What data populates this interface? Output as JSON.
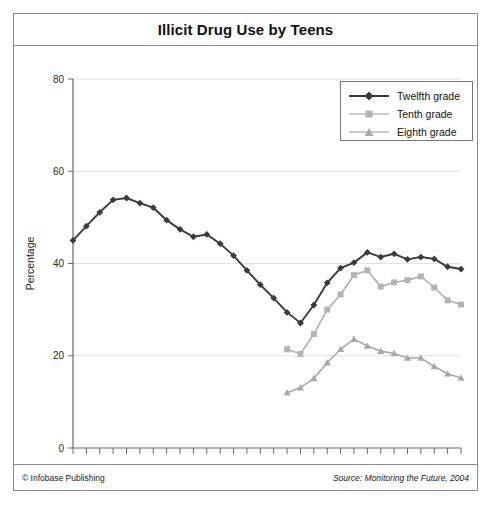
{
  "chart_data": {
    "type": "line",
    "title": "Illicit Drug Use by Teens",
    "xlabel": "Year",
    "ylabel": "Percentage",
    "ylim": [
      0,
      80
    ],
    "yticks": [
      0,
      20,
      40,
      60,
      80
    ],
    "ytick_labels": [
      "0",
      "20",
      "40",
      "60",
      "80"
    ],
    "xlim": [
      1975,
      2004
    ],
    "xtick_labels": [
      "'76",
      "'78",
      "'80",
      "'82",
      "'84",
      "'86",
      "'88",
      "'90",
      "'92",
      "'94",
      "'96",
      "'98",
      "'00",
      "'02",
      "'04"
    ],
    "xtick_years": [
      1976,
      1978,
      1980,
      1982,
      1984,
      1986,
      1988,
      1990,
      1992,
      1994,
      1996,
      1998,
      2000,
      2002,
      2004
    ],
    "minor_tick_years": [
      1975,
      1977,
      1979,
      1981,
      1983,
      1985,
      1987,
      1989,
      1991,
      1993,
      1995,
      1997,
      1999,
      2001,
      2003
    ],
    "grid": "horizontal",
    "legend_position": "top-right",
    "series": [
      {
        "name": "Twelfth grade",
        "marker": "diamond",
        "color": "#3b3b3b",
        "x": [
          1975,
          1976,
          1977,
          1978,
          1979,
          1980,
          1981,
          1982,
          1983,
          1984,
          1985,
          1986,
          1987,
          1988,
          1989,
          1990,
          1991,
          1992,
          1993,
          1994,
          1995,
          1996,
          1997,
          1998,
          1999,
          2000,
          2001,
          2002,
          2003,
          2004
        ],
        "values": [
          45.0,
          48.1,
          51.1,
          53.8,
          54.2,
          53.1,
          52.1,
          49.4,
          47.4,
          45.8,
          46.3,
          44.3,
          41.7,
          38.5,
          35.4,
          32.5,
          29.4,
          27.1,
          31.0,
          35.8,
          39.0,
          40.2,
          42.4,
          41.4,
          42.1,
          40.9,
          41.4,
          41.0,
          39.3,
          38.8
        ]
      },
      {
        "name": "Tenth grade",
        "marker": "square",
        "color": "#b4b4b4",
        "x": [
          1991,
          1992,
          1993,
          1994,
          1995,
          1996,
          1997,
          1998,
          1999,
          2000,
          2001,
          2002,
          2003,
          2004
        ],
        "values": [
          21.4,
          20.4,
          24.7,
          30.0,
          33.3,
          37.5,
          38.5,
          35.0,
          35.9,
          36.4,
          37.2,
          34.8,
          32.0,
          31.1
        ]
      },
      {
        "name": "Eighth grade",
        "marker": "triangle",
        "color": "#a8a8a8",
        "x": [
          1991,
          1992,
          1993,
          1994,
          1995,
          1996,
          1997,
          1998,
          1999,
          2000,
          2001,
          2002,
          2003,
          2004
        ],
        "values": [
          12.0,
          13.1,
          15.1,
          18.5,
          21.4,
          23.6,
          22.1,
          21.0,
          20.5,
          19.5,
          19.5,
          17.7,
          16.1,
          15.2
        ]
      }
    ]
  },
  "legend": {
    "entries": [
      {
        "label": "Twelfth grade",
        "marker": "diamond"
      },
      {
        "label": "Tenth grade",
        "marker": "square"
      },
      {
        "label": "Eighth grade",
        "marker": "triangle"
      }
    ]
  },
  "footer": {
    "copyright": "© Infobase Publishing",
    "source": "Source: Monitoring the Future, 2004"
  },
  "colors": {
    "twelfth": "#3b3b3b",
    "tenth": "#b4b4b4",
    "eighth": "#a8a8a8",
    "grid": "#e2e2e2",
    "axis": "#6a6a6a",
    "border": "#8d8d8d"
  }
}
